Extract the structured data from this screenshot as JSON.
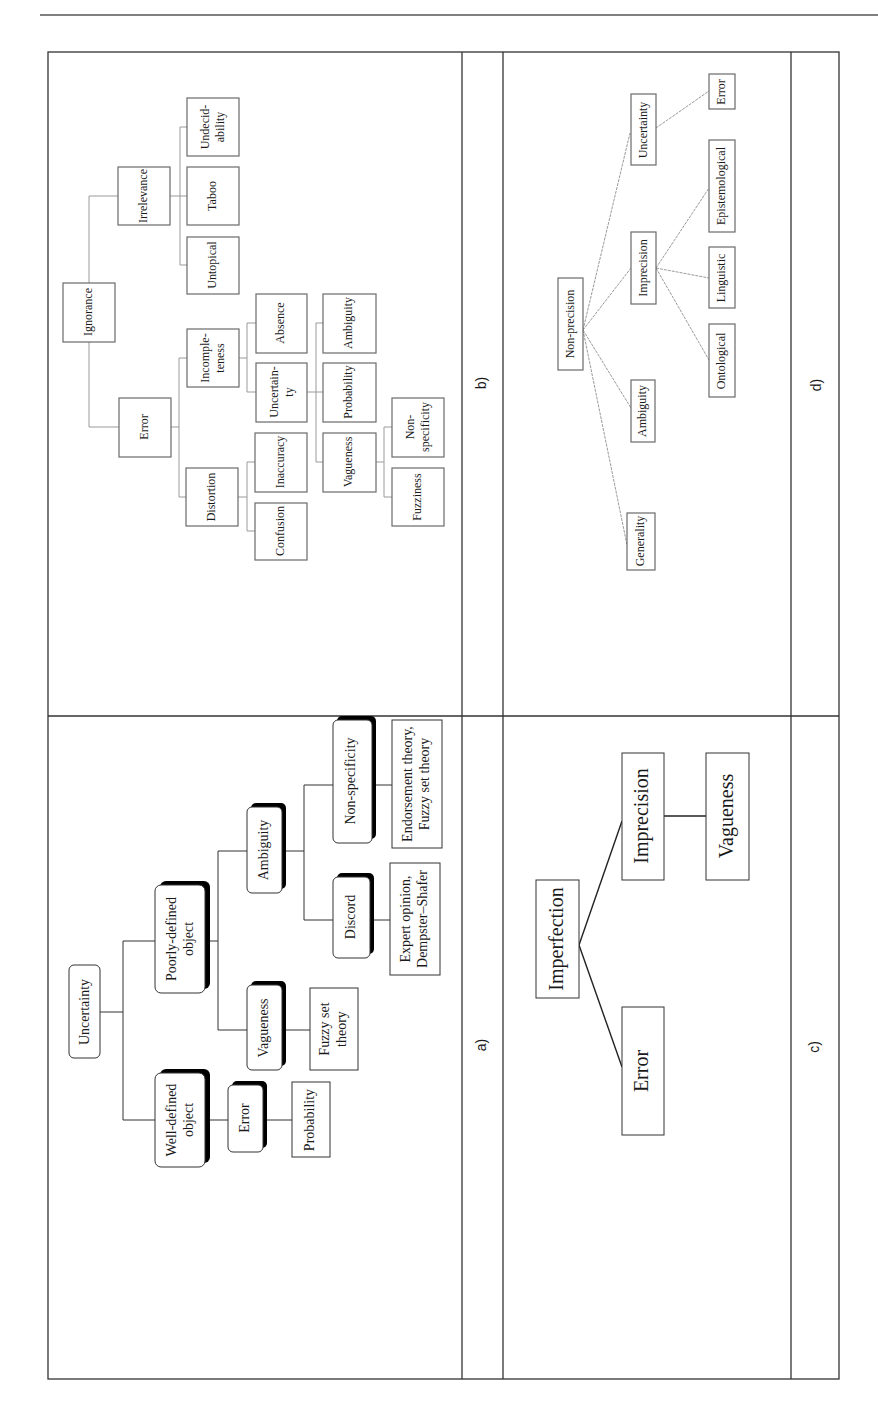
{
  "page": {
    "header_rule": true
  },
  "figure": {
    "orientation": "rotated-90-ccw",
    "panels": {
      "a": {
        "label": "a)",
        "nodes": {
          "uncertainty": "Uncertainty",
          "well_defined_1": "Well-defined",
          "well_defined_2": "object",
          "poorly_defined_1": "Poorly-defined",
          "poorly_defined_2": "object",
          "error": "Error",
          "probability": "Probability",
          "vagueness": "Vagueness",
          "fuzzy_set_1": "Fuzzy set",
          "fuzzy_set_2": "theory",
          "ambiguity": "Ambiguity",
          "discord": "Discord",
          "non_specificity": "Non-specificity",
          "expert_1": "Expert opinion,",
          "expert_2": "Dempster–Shafer",
          "endorsement_1": "Endorsement theory,",
          "endorsement_2": "Fuzzy set theory"
        }
      },
      "b": {
        "label": "b)",
        "nodes": {
          "ignorance": "Ignorance",
          "irrelevance": "Irrelevance",
          "error": "Error",
          "untopical": "Untopical",
          "taboo": "Taboo",
          "undecidability_1": "Undecid-",
          "undecidability_2": "ability",
          "incompleteness_1": "Incomple-",
          "incompleteness_2": "teness",
          "distortion": "Distortion",
          "absence": "Absence",
          "uncertainty_1": "Uncertain-",
          "uncertainty_2": "ty",
          "inaccuracy": "Inaccuracy",
          "confusion": "Confusion",
          "ambiguity": "Ambiguity",
          "probability": "Probability",
          "vagueness": "Vagueness",
          "non_specificity_1": "Non-",
          "non_specificity_2": "specificity",
          "fuzziness": "Fuzziness"
        }
      },
      "c": {
        "label": "c)",
        "nodes": {
          "imperfection": "Imperfection",
          "error": "Error",
          "imprecision": "Imprecision",
          "vagueness": "Vagueness"
        }
      },
      "d": {
        "label": "d)",
        "nodes": {
          "non_precision": "Non-precision",
          "generality": "Generality",
          "ambiguity": "Ambiguity",
          "imprecision": "Imprecision",
          "uncertainty": "Uncertainty",
          "ontological": "Ontological",
          "linguistic": "Linguistic",
          "epistemological": "Epistemological",
          "error": "Error"
        }
      }
    }
  }
}
